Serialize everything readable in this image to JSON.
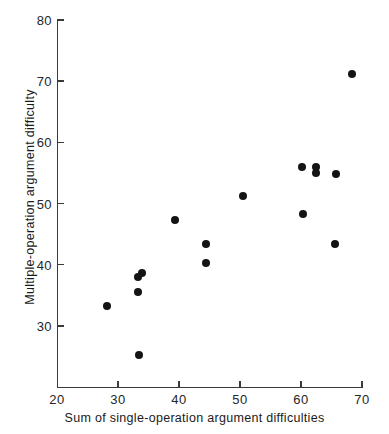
{
  "chart_data": {
    "type": "scatter",
    "title": "",
    "xlabel": "Sum of single-operation argument difficulties",
    "ylabel": "Multiple-operation argument difficulty",
    "xlim": [
      20,
      70
    ],
    "ylim": [
      20,
      80
    ],
    "xticks": [
      20,
      30,
      40,
      50,
      60,
      70
    ],
    "yticks": [
      30,
      40,
      50,
      60,
      70,
      80
    ],
    "xtick_labels": [
      "20",
      "30",
      "40",
      "50",
      "60",
      "70"
    ],
    "ytick_labels": [
      "30",
      "40",
      "50",
      "60",
      "70",
      "80"
    ],
    "grid": false,
    "legend": null,
    "marker": "filled-circle",
    "marker_color": "#141414",
    "axis_color": "#3a3a3a",
    "background_color": "#ffffff",
    "points": [
      {
        "x": 28.2,
        "y": 33.2
      },
      {
        "x": 33.4,
        "y": 25.2
      },
      {
        "x": 33.3,
        "y": 35.5
      },
      {
        "x": 33.3,
        "y": 38.0
      },
      {
        "x": 33.9,
        "y": 38.7
      },
      {
        "x": 39.4,
        "y": 47.3
      },
      {
        "x": 44.4,
        "y": 43.3
      },
      {
        "x": 44.4,
        "y": 40.2
      },
      {
        "x": 50.5,
        "y": 51.2
      },
      {
        "x": 60.1,
        "y": 55.9
      },
      {
        "x": 60.4,
        "y": 48.3
      },
      {
        "x": 62.4,
        "y": 56.0
      },
      {
        "x": 62.4,
        "y": 55.0
      },
      {
        "x": 65.7,
        "y": 54.8
      },
      {
        "x": 65.6,
        "y": 43.3
      },
      {
        "x": 68.3,
        "y": 71.1
      }
    ]
  }
}
